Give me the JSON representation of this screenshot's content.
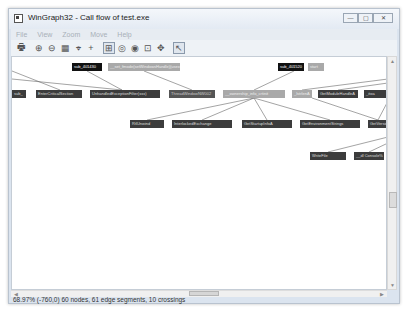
{
  "window": {
    "title": "WinGraph32 - Call flow of test.exe",
    "controls": {
      "minimize": "—",
      "maximize": "▢",
      "close": "✕"
    }
  },
  "menubar": {
    "items": [
      {
        "label": "File"
      },
      {
        "label": "View"
      },
      {
        "label": "Zoom"
      },
      {
        "label": "Move"
      },
      {
        "label": "Help"
      }
    ]
  },
  "toolbar": {
    "buttons": [
      {
        "name": "print-icon",
        "glyph": "🖶"
      },
      {
        "name": "zoom-in-icon",
        "glyph": "⊕"
      },
      {
        "name": "zoom-out-icon",
        "glyph": "⊖"
      },
      {
        "name": "fit-icon",
        "glyph": "▦"
      },
      {
        "name": "zoom-rect-icon",
        "glyph": "⌖"
      },
      {
        "name": "crosshair-icon",
        "glyph": "+"
      },
      {
        "name": "layout-icon",
        "glyph": "⊞"
      },
      {
        "name": "rotate-icon",
        "glyph": "◎"
      },
      {
        "name": "fisheye-icon",
        "glyph": "◉"
      },
      {
        "name": "nodes-icon",
        "glyph": "⊡"
      },
      {
        "name": "move-icon",
        "glyph": "✥"
      },
      {
        "name": "select-icon",
        "glyph": "↖"
      }
    ]
  },
  "graph": {
    "nodes": [
      {
        "id": "n1",
        "label": "sub_401430",
        "style": "black",
        "x": 60,
        "y": 6,
        "w": 30
      },
      {
        "id": "n2",
        "label": "__set_fmode(setWindowsHandle)(usexxxxx)",
        "style": "light",
        "x": 96,
        "y": 6,
        "w": 72
      },
      {
        "id": "n3",
        "label": "sub_401520",
        "style": "black",
        "x": 266,
        "y": 6,
        "w": 26
      },
      {
        "id": "n4",
        "label": "start",
        "style": "light",
        "x": 296,
        "y": 6,
        "w": 16
      },
      {
        "id": "n5",
        "label": "sub_",
        "style": "dark",
        "x": 0,
        "y": 33,
        "w": 14
      },
      {
        "id": "n6",
        "label": "EnterCriticalSection",
        "style": "dark",
        "x": 24,
        "y": 33,
        "w": 46
      },
      {
        "id": "n7",
        "label": "UnhandledExceptionFilter(xxx)",
        "style": "dark",
        "x": 78,
        "y": 33,
        "w": 70
      },
      {
        "id": "n8",
        "label": "ThreadWindowNW002",
        "style": "mid",
        "x": 157,
        "y": 33,
        "w": 46
      },
      {
        "id": "n9",
        "label": "__ownership_info_crtinit",
        "style": "light",
        "x": 211,
        "y": 33,
        "w": 62
      },
      {
        "id": "n10",
        "label": "_lstrlenA",
        "style": "light",
        "x": 280,
        "y": 33,
        "w": 20
      },
      {
        "id": "n11",
        "label": "GetModuleHandleA",
        "style": "dark",
        "x": 306,
        "y": 33,
        "w": 40
      },
      {
        "id": "n12",
        "label": "_itoa",
        "style": "dark",
        "x": 352,
        "y": 33,
        "w": 22
      },
      {
        "id": "n13",
        "label": "RtlUnwind",
        "style": "dark",
        "x": 118,
        "y": 63,
        "w": 34
      },
      {
        "id": "n14",
        "label": "InterlockedExchange",
        "style": "dark",
        "x": 160,
        "y": 63,
        "w": 60
      },
      {
        "id": "n15",
        "label": "GetStartupInfoA",
        "style": "dark",
        "x": 230,
        "y": 63,
        "w": 50
      },
      {
        "id": "n16",
        "label": "GetEnvironmentStrings",
        "style": "dark",
        "x": 288,
        "y": 63,
        "w": 60
      },
      {
        "id": "n17",
        "label": "GetVersion",
        "style": "dark",
        "x": 356,
        "y": 63,
        "w": 20
      },
      {
        "id": "n18",
        "label": "WriteFile",
        "style": "dark",
        "x": 298,
        "y": 95,
        "w": 36
      },
      {
        "id": "n19",
        "label": "__dl Console%",
        "style": "dark",
        "x": 342,
        "y": 95,
        "w": 30
      },
      {
        "id": "n20",
        "label": "",
        "style": "dark",
        "x": 375,
        "y": 95,
        "w": 4
      }
    ]
  },
  "statusbar": {
    "text": "68.97% (-760,0) 60 nodes, 61 edge segments, 10 crossings"
  }
}
